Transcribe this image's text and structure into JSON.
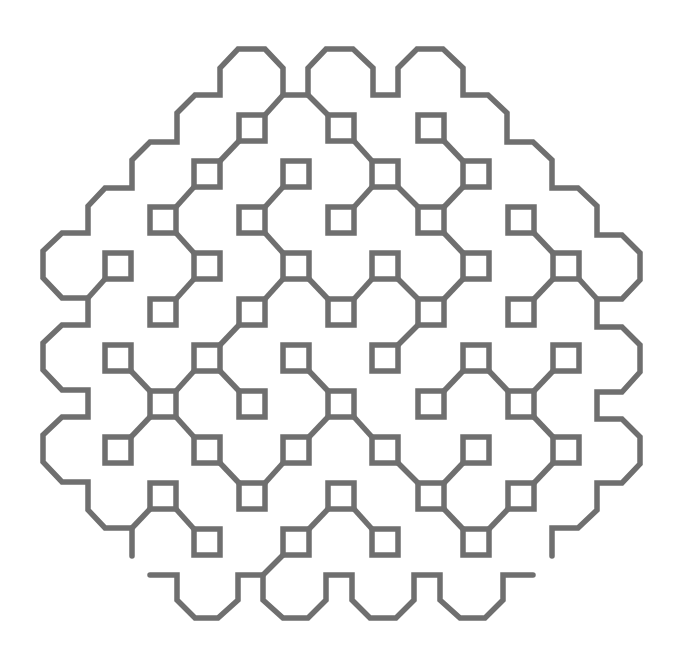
{
  "figure": {
    "width": 680,
    "height": 663,
    "background": "#ffffff",
    "stroke_color": "#6f6f6f",
    "stroke_width": 5.5,
    "square_half_size": 13
  },
  "squares": [
    [
      252,
      128
    ],
    [
      341,
      128
    ],
    [
      431,
      128
    ],
    [
      207,
      174
    ],
    [
      296,
      174
    ],
    [
      385,
      174
    ],
    [
      476,
      174
    ],
    [
      163,
      220
    ],
    [
      252,
      220
    ],
    [
      341,
      220
    ],
    [
      431,
      220
    ],
    [
      521,
      220
    ],
    [
      118,
      266
    ],
    [
      207,
      266
    ],
    [
      296,
      266
    ],
    [
      385,
      266
    ],
    [
      476,
      266
    ],
    [
      566,
      266
    ],
    [
      163,
      312
    ],
    [
      252,
      312
    ],
    [
      341,
      312
    ],
    [
      431,
      312
    ],
    [
      521,
      312
    ],
    [
      118,
      358
    ],
    [
      207,
      358
    ],
    [
      296,
      358
    ],
    [
      385,
      358
    ],
    [
      476,
      358
    ],
    [
      566,
      358
    ],
    [
      163,
      404
    ],
    [
      252,
      404
    ],
    [
      341,
      404
    ],
    [
      431,
      404
    ],
    [
      521,
      404
    ],
    [
      118,
      450
    ],
    [
      207,
      450
    ],
    [
      296,
      450
    ],
    [
      385,
      450
    ],
    [
      476,
      450
    ],
    [
      566,
      450
    ],
    [
      163,
      496
    ],
    [
      252,
      496
    ],
    [
      341,
      496
    ],
    [
      431,
      496
    ],
    [
      521,
      496
    ],
    [
      207,
      542
    ],
    [
      296,
      542
    ],
    [
      385,
      542
    ],
    [
      476,
      542
    ]
  ],
  "links": [
    [
      [
        252,
        128
      ],
      [
        207,
        174
      ]
    ],
    [
      [
        207,
        174
      ],
      [
        163,
        220
      ]
    ],
    [
      [
        163,
        220
      ],
      [
        207,
        266
      ]
    ],
    [
      [
        207,
        266
      ],
      [
        163,
        312
      ]
    ],
    [
      [
        296,
        174
      ],
      [
        252,
        220
      ]
    ],
    [
      [
        252,
        220
      ],
      [
        296,
        266
      ]
    ],
    [
      [
        296,
        266
      ],
      [
        252,
        312
      ]
    ],
    [
      [
        296,
        266
      ],
      [
        341,
        312
      ]
    ],
    [
      [
        341,
        128
      ],
      [
        385,
        174
      ]
    ],
    [
      [
        385,
        174
      ],
      [
        341,
        220
      ]
    ],
    [
      [
        385,
        174
      ],
      [
        431,
        220
      ]
    ],
    [
      [
        431,
        128
      ],
      [
        476,
        174
      ]
    ],
    [
      [
        476,
        174
      ],
      [
        431,
        220
      ]
    ],
    [
      [
        431,
        220
      ],
      [
        476,
        266
      ]
    ],
    [
      [
        385,
        266
      ],
      [
        341,
        312
      ]
    ],
    [
      [
        385,
        266
      ],
      [
        431,
        312
      ]
    ],
    [
      [
        476,
        266
      ],
      [
        431,
        312
      ]
    ],
    [
      [
        431,
        312
      ],
      [
        385,
        358
      ]
    ],
    [
      [
        521,
        220
      ],
      [
        566,
        266
      ]
    ],
    [
      [
        566,
        266
      ],
      [
        521,
        312
      ]
    ],
    [
      [
        252,
        312
      ],
      [
        207,
        358
      ]
    ],
    [
      [
        118,
        358
      ],
      [
        163,
        404
      ]
    ],
    [
      [
        207,
        358
      ],
      [
        163,
        404
      ]
    ],
    [
      [
        207,
        358
      ],
      [
        252,
        404
      ]
    ],
    [
      [
        163,
        404
      ],
      [
        118,
        450
      ]
    ],
    [
      [
        163,
        404
      ],
      [
        207,
        450
      ]
    ],
    [
      [
        296,
        358
      ],
      [
        341,
        404
      ]
    ],
    [
      [
        207,
        450
      ],
      [
        252,
        496
      ]
    ],
    [
      [
        296,
        450
      ],
      [
        252,
        496
      ]
    ],
    [
      [
        296,
        450
      ],
      [
        341,
        404
      ]
    ],
    [
      [
        163,
        496
      ],
      [
        207,
        542
      ]
    ],
    [
      [
        341,
        496
      ],
      [
        296,
        542
      ]
    ],
    [
      [
        341,
        496
      ],
      [
        385,
        542
      ]
    ],
    [
      [
        476,
        358
      ],
      [
        431,
        404
      ]
    ],
    [
      [
        476,
        358
      ],
      [
        521,
        404
      ]
    ],
    [
      [
        521,
        404
      ],
      [
        566,
        358
      ]
    ],
    [
      [
        341,
        404
      ],
      [
        385,
        450
      ]
    ],
    [
      [
        385,
        450
      ],
      [
        431,
        496
      ]
    ],
    [
      [
        476,
        450
      ],
      [
        431,
        496
      ]
    ],
    [
      [
        521,
        404
      ],
      [
        566,
        450
      ]
    ],
    [
      [
        566,
        450
      ],
      [
        521,
        496
      ]
    ],
    [
      [
        431,
        496
      ],
      [
        476,
        542
      ]
    ],
    [
      [
        521,
        496
      ],
      [
        476,
        542
      ]
    ]
  ],
  "rim_links": [
    [
      [
        283,
        95
      ],
      [
        265,
        115
      ]
    ],
    [
      [
        308,
        95
      ],
      [
        328,
        115
      ]
    ],
    [
      [
        88,
        298
      ],
      [
        105,
        279
      ]
    ],
    [
      [
        597,
        299
      ],
      [
        579,
        279
      ]
    ],
    [
      [
        132,
        528
      ],
      [
        150,
        509
      ]
    ],
    [
      [
        263,
        575
      ],
      [
        283,
        555
      ]
    ]
  ],
  "paths": [
    {
      "name": "outer-rim",
      "round_ends": true,
      "points": [
        [
          132,
          556
        ],
        [
          132,
          528
        ],
        [
          105,
          528
        ],
        [
          88,
          510
        ],
        [
          88,
          482
        ],
        [
          62,
          482
        ],
        [
          43,
          462
        ],
        [
          43,
          435
        ],
        [
          62,
          417
        ],
        [
          88,
          417
        ],
        [
          88,
          390
        ],
        [
          62,
          390
        ],
        [
          43,
          370
        ],
        [
          43,
          343
        ],
        [
          62,
          325
        ],
        [
          88,
          325
        ],
        [
          88,
          298
        ],
        [
          62,
          298
        ],
        [
          43,
          278
        ],
        [
          43,
          251
        ],
        [
          62,
          233
        ],
        [
          88,
          233
        ],
        [
          88,
          206
        ],
        [
          105,
          188
        ],
        [
          132,
          188
        ],
        [
          132,
          160
        ],
        [
          150,
          142
        ],
        [
          177,
          142
        ],
        [
          177,
          113
        ],
        [
          195,
          95
        ],
        [
          220,
          95
        ],
        [
          220,
          68
        ],
        [
          238,
          49
        ],
        [
          265,
          49
        ],
        [
          283,
          68
        ],
        [
          283,
          95
        ],
        [
          308,
          95
        ],
        [
          308,
          68
        ],
        [
          326,
          49
        ],
        [
          353,
          49
        ],
        [
          373,
          68
        ],
        [
          373,
          95
        ],
        [
          398,
          95
        ],
        [
          398,
          68
        ],
        [
          417,
          49
        ],
        [
          443,
          49
        ],
        [
          463,
          68
        ],
        [
          463,
          95
        ],
        [
          488,
          95
        ],
        [
          507,
          113
        ],
        [
          507,
          142
        ],
        [
          533,
          142
        ],
        [
          552,
          160
        ],
        [
          552,
          188
        ],
        [
          578,
          188
        ],
        [
          597,
          206
        ],
        [
          597,
          235
        ],
        [
          622,
          235
        ],
        [
          640,
          253
        ],
        [
          640,
          280
        ],
        [
          622,
          299
        ],
        [
          597,
          299
        ],
        [
          597,
          327
        ],
        [
          622,
          327
        ],
        [
          640,
          345
        ],
        [
          640,
          372
        ],
        [
          622,
          392
        ],
        [
          597,
          392
        ],
        [
          597,
          419
        ],
        [
          622,
          419
        ],
        [
          640,
          437
        ],
        [
          640,
          464
        ],
        [
          622,
          483
        ],
        [
          597,
          483
        ],
        [
          597,
          510
        ],
        [
          578,
          528
        ],
        [
          552,
          528
        ],
        [
          552,
          556
        ]
      ]
    },
    {
      "name": "bottom-wave",
      "round_ends": true,
      "points": [
        [
          150,
          575
        ],
        [
          177,
          575
        ],
        [
          177,
          600
        ],
        [
          195,
          618
        ],
        [
          218,
          618
        ],
        [
          238,
          600
        ],
        [
          238,
          575
        ],
        [
          263,
          575
        ],
        [
          263,
          600
        ],
        [
          283,
          618
        ],
        [
          308,
          618
        ],
        [
          326,
          600
        ],
        [
          326,
          575
        ],
        [
          352,
          575
        ],
        [
          352,
          600
        ],
        [
          370,
          618
        ],
        [
          396,
          618
        ],
        [
          414,
          600
        ],
        [
          414,
          575
        ],
        [
          440,
          575
        ],
        [
          440,
          600
        ],
        [
          460,
          618
        ],
        [
          485,
          618
        ],
        [
          503,
          600
        ],
        [
          503,
          575
        ],
        [
          533,
          575
        ]
      ]
    }
  ]
}
